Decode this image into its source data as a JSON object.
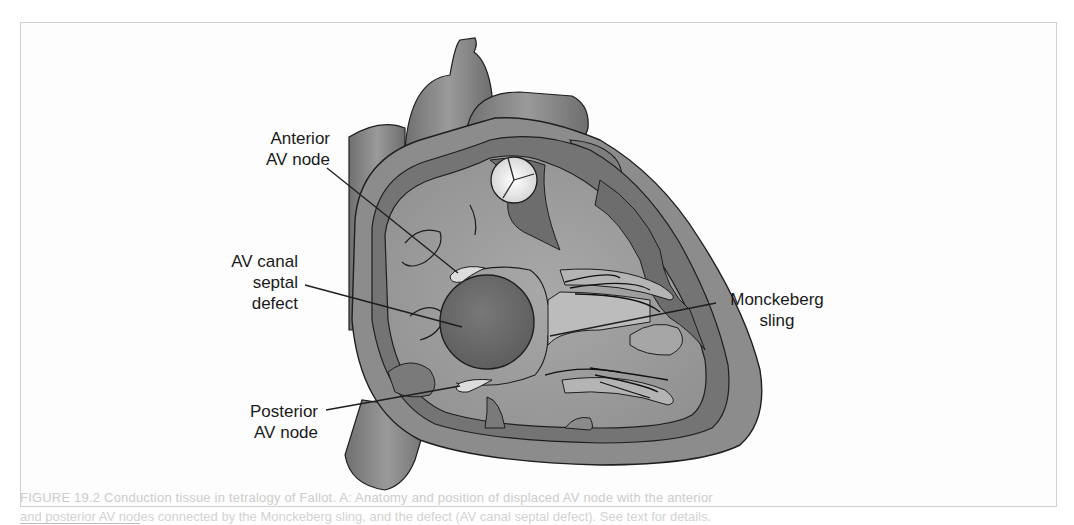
{
  "figure": {
    "labels": {
      "anterior_av_node": "Anterior\nAV node",
      "av_canal_septal_defect": "AV canal\nseptal\ndefect",
      "posterior_av_node": "Posterior\nAV node",
      "monckeberg_sling": "Monckeberg\nsling"
    },
    "caption_ghost_line1": "FIGURE 19.2 Conduction tissue in tetralogy of Fallot. A: Anatomy and position of displaced AV node with the anterior",
    "caption_ghost_line2": "and posterior AV nodes connected by the Monckeberg sling, and the defect (AV canal septal defect). See text for details."
  },
  "colors": {
    "background": "#ffffff",
    "frame_border": "#cfcfcf",
    "heart_outer": "#8e8e8e",
    "heart_wall_dark": "#6f6f6f",
    "heart_interior": "#9d9d9d",
    "defect": "#6a6a6a",
    "node_fill": "#d9d9d9",
    "valve_fill": "#ececec",
    "outline": "#1e1e1e",
    "label_text": "#1a1a1a"
  }
}
